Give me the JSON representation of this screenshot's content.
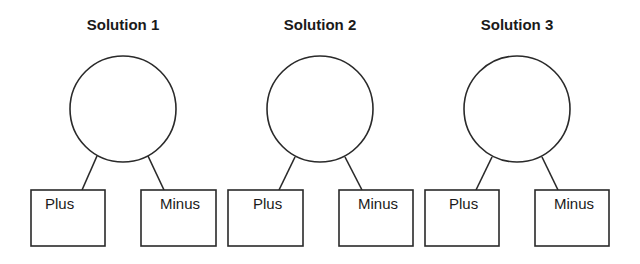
{
  "diagram": {
    "solutions": [
      {
        "title": "Solution 1",
        "circle": {
          "cx": 123,
          "cy": 109,
          "r": 53
        },
        "plus": {
          "label": "Plus",
          "x": 31,
          "y": 190,
          "w": 74,
          "h": 56
        },
        "minus": {
          "label": "Minus",
          "x": 141,
          "y": 190,
          "w": 75,
          "h": 56
        }
      },
      {
        "title": "Solution 2",
        "circle": {
          "cx": 320,
          "cy": 109,
          "r": 53
        },
        "plus": {
          "label": "Plus",
          "x": 228,
          "y": 190,
          "w": 75,
          "h": 56
        },
        "minus": {
          "label": "Minus",
          "x": 339,
          "y": 190,
          "w": 74,
          "h": 56
        }
      },
      {
        "title": "Solution 3",
        "circle": {
          "cx": 517,
          "cy": 109,
          "r": 53
        },
        "plus": {
          "label": "Plus",
          "x": 425,
          "y": 190,
          "w": 74,
          "h": 56
        },
        "minus": {
          "label": "Minus",
          "x": 535,
          "y": 190,
          "w": 74,
          "h": 56
        }
      }
    ],
    "stroke_color": "#2a2a2a",
    "text_color": "#1a1a1a"
  }
}
